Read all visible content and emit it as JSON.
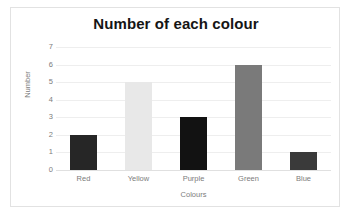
{
  "chart_data": {
    "type": "bar",
    "title": "Number of each colour",
    "xlabel": "Colours",
    "ylabel": "Number",
    "categories": [
      "Red",
      "Yellow",
      "Purple",
      "Green",
      "Blue"
    ],
    "values": [
      2,
      5,
      3,
      6,
      1
    ],
    "bar_colors": [
      "#262626",
      "#e8e8e8",
      "#121212",
      "#7a7a7a",
      "#3a3a3a"
    ],
    "ylim": [
      0,
      7
    ],
    "ytick_labels": [
      "0",
      "1",
      "2",
      "3",
      "4",
      "5",
      "6",
      "7"
    ],
    "ytick_values": [
      0,
      1,
      2,
      3,
      4,
      5,
      6,
      7
    ],
    "grid": true,
    "legend": false,
    "legend_position": "none",
    "background_color": "#ffffff",
    "gridline_color": "#eeeeee",
    "axis_text_color": "#7c7c7c",
    "title_color": "#151515",
    "border_color": "#e2e2e2"
  }
}
